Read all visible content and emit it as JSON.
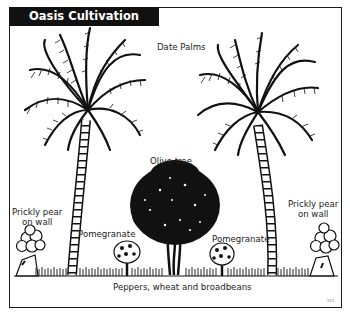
{
  "title": "Oasis Cultivation",
  "labels": {
    "date_palms": "Date Palms",
    "olive_tree": "Olive tree",
    "prickly_pear_left_l1": "Prickly pear",
    "prickly_pear_left_l2": "on wall",
    "prickly_pear_right_l1": "Prickly pear",
    "prickly_pear_right_l2": "on wall",
    "pomegranate_left": "Pomegranate",
    "pomegranate_right": "Pomegranate",
    "ground_crops": "Peppers, wheat and broadbeans"
  },
  "figure_ref": "201",
  "colors": {
    "ink": "#111111",
    "title_bg": "#111111",
    "title_fg": "#ffffff",
    "paper": "#ffffff"
  }
}
